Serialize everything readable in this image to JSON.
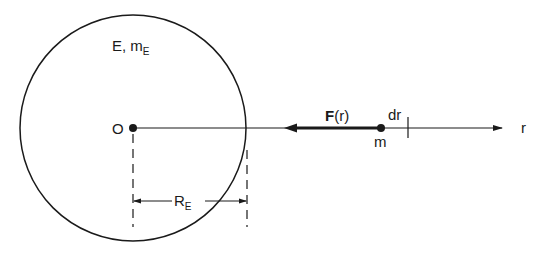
{
  "figure": {
    "type": "physics-diagram"
  },
  "labels": {
    "earth": {
      "main": "E, m",
      "sub": "E"
    },
    "origin": "O",
    "force": {
      "bold": "F",
      "arg": "(r)"
    },
    "mass": "m",
    "increment": "dr",
    "axis": "r",
    "radius": {
      "main": "R",
      "sub": "E"
    }
  },
  "colors": {
    "stroke": "#1a1a1a",
    "background": "#ffffff"
  },
  "geometry": {
    "earth_center": [
      133,
      127
    ],
    "earth_radius": 113,
    "mass_position": [
      381,
      128
    ],
    "dr_tick_x": 413,
    "axis_end_x": 502,
    "force_arrow": {
      "from_x": 381,
      "to_x": 287
    },
    "radius_dimension_y": 201
  }
}
